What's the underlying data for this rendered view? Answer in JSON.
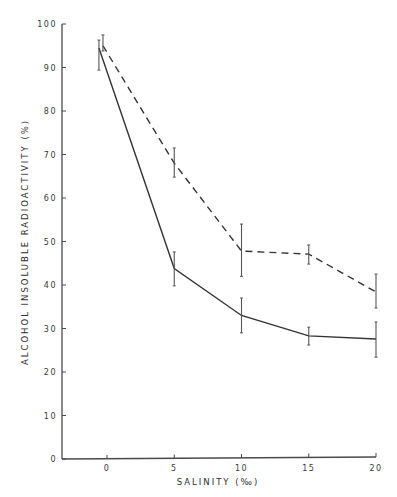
{
  "chart_data": {
    "type": "line",
    "title": "",
    "xlabel": "SALINITY (‰)",
    "ylabel": "ALCOHOL INSOLUBLE RADIOACTIVITY (%)",
    "xlim": [
      -3.4,
      20
    ],
    "ylim": [
      0,
      100
    ],
    "x_ticks": [
      0,
      5,
      10,
      15,
      20
    ],
    "y_ticks": [
      0,
      10,
      20,
      30,
      40,
      50,
      60,
      70,
      80,
      90,
      100
    ],
    "grid": false,
    "legend": null,
    "series": [
      {
        "name": "solid",
        "line_style": "solid",
        "x": [
          -0.6,
          5,
          10,
          15,
          20
        ],
        "values": [
          94.5,
          43.8,
          33.0,
          28.3,
          27.6
        ],
        "err_low": [
          89.4,
          39.8,
          29.0,
          26.2,
          23.4
        ],
        "err_high": [
          96.3,
          47.6,
          37.0,
          30.3,
          31.5
        ]
      },
      {
        "name": "dashed",
        "line_style": "dashed",
        "x": [
          -0.3,
          5,
          10,
          15,
          20
        ],
        "values": [
          95.0,
          68.0,
          47.8,
          47.1,
          38.4
        ],
        "err_low": [
          93.8,
          64.8,
          42.0,
          44.8,
          34.7
        ],
        "err_high": [
          97.5,
          71.5,
          54.0,
          49.2,
          42.5
        ]
      }
    ]
  }
}
